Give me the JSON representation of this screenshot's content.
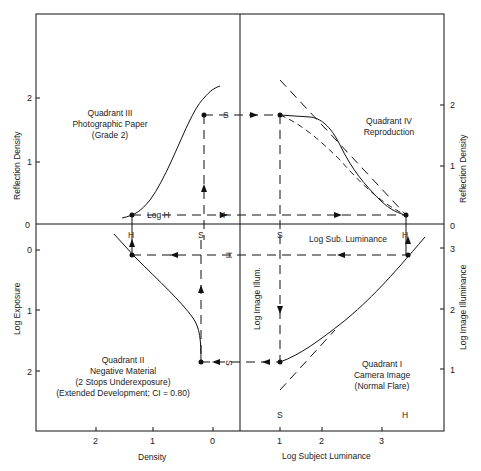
{
  "diagram": {
    "quadrants": {
      "q1": {
        "lines": [
          "Quadrant I",
          "Camera Image",
          "(Normal Flare)"
        ]
      },
      "q2": {
        "lines": [
          "Quadrant II",
          "Negative Material",
          "(2 Stops Underexposure)",
          "(Extended Development; CI = 0.80)"
        ]
      },
      "q3": {
        "lines": [
          "Quadrant III",
          "Photographic Paper",
          "(Grade 2)"
        ]
      },
      "q4": {
        "lines": [
          "Quadrant IV",
          "Reproduction"
        ]
      }
    },
    "axes": {
      "left_top": {
        "label": "Reflection Density",
        "ticks": [
          "2",
          "1",
          "0"
        ]
      },
      "left_bottom": {
        "label": "Log Exposure",
        "ticks": [
          "0",
          "1",
          "2"
        ]
      },
      "right_top": {
        "label": "Reflection Density",
        "ticks": [
          "2",
          "1",
          "0"
        ]
      },
      "right_bottom": {
        "label": "Log Image Illuminance",
        "ticks": [
          "3",
          "2",
          "1"
        ]
      },
      "bottom_left": {
        "label": "Density",
        "ticks": [
          "2",
          "1",
          "0"
        ]
      },
      "bottom_right": {
        "label": "Log Subject Luminance",
        "ticks": [
          "1",
          "2",
          "3"
        ]
      }
    },
    "inner_labels": {
      "log_h": "Log H",
      "h": "H",
      "s": "S",
      "log_sub_luminance": "Log Sub. Luminance",
      "log_image_illum": "Log Image Illum."
    },
    "markers": {
      "s": "S",
      "h": "H"
    }
  }
}
